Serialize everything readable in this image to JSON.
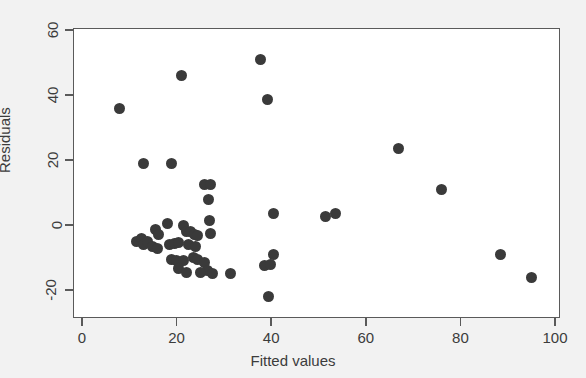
{
  "chart_data": {
    "type": "scatter",
    "title": "",
    "xlabel": "Fitted values",
    "ylabel": "Residuals",
    "xlim": [
      -2,
      102
    ],
    "ylim": [
      -25,
      63
    ],
    "xticks": [
      0,
      20,
      40,
      60,
      80,
      100
    ],
    "xtick_labels": [
      "0",
      "20",
      "40",
      "60",
      "80",
      "100"
    ],
    "yticks": [
      -20,
      0,
      20,
      40,
      60
    ],
    "ytick_labels": [
      "-20",
      "0",
      "20",
      "40",
      "60"
    ],
    "grid": false,
    "legend": null,
    "marker": {
      "shape": "circle",
      "color": "#3a3a3a",
      "size_px": 11
    },
    "background_color": "#f2f2f2",
    "plot_background_color": "#ffffff",
    "axis_color": "#5a5a5a",
    "points": [
      {
        "x": 8.0,
        "y": 36.0
      },
      {
        "x": 13.0,
        "y": 19.0
      },
      {
        "x": 19.0,
        "y": 19.0
      },
      {
        "x": 21.0,
        "y": 46.0
      },
      {
        "x": 37.7,
        "y": 51.0
      },
      {
        "x": 39.3,
        "y": 38.5
      },
      {
        "x": 67.0,
        "y": 23.5
      },
      {
        "x": 76.0,
        "y": 11.0
      },
      {
        "x": 88.5,
        "y": -9.0
      },
      {
        "x": 95.0,
        "y": -16.0
      },
      {
        "x": 26.0,
        "y": 12.5
      },
      {
        "x": 27.2,
        "y": 12.5
      },
      {
        "x": 26.8,
        "y": 8.0
      },
      {
        "x": 27.0,
        "y": 1.5
      },
      {
        "x": 27.2,
        "y": -2.5
      },
      {
        "x": 40.5,
        "y": 3.5
      },
      {
        "x": 51.5,
        "y": 2.5
      },
      {
        "x": 53.5,
        "y": 3.5
      },
      {
        "x": 18.0,
        "y": 0.5
      },
      {
        "x": 21.5,
        "y": 0.0
      },
      {
        "x": 15.5,
        "y": -1.5
      },
      {
        "x": 16.2,
        "y": -3.0
      },
      {
        "x": 22.0,
        "y": -2.0
      },
      {
        "x": 23.0,
        "y": -2.0
      },
      {
        "x": 23.8,
        "y": -2.8
      },
      {
        "x": 24.5,
        "y": -3.2
      },
      {
        "x": 11.5,
        "y": -5.0
      },
      {
        "x": 12.5,
        "y": -4.2
      },
      {
        "x": 13.0,
        "y": -6.0
      },
      {
        "x": 13.8,
        "y": -5.0
      },
      {
        "x": 15.0,
        "y": -6.5
      },
      {
        "x": 16.0,
        "y": -7.2
      },
      {
        "x": 18.5,
        "y": -6.0
      },
      {
        "x": 19.5,
        "y": -5.8
      },
      {
        "x": 20.5,
        "y": -5.5
      },
      {
        "x": 22.5,
        "y": -6.0
      },
      {
        "x": 24.0,
        "y": -6.5
      },
      {
        "x": 19.0,
        "y": -10.5
      },
      {
        "x": 20.0,
        "y": -11.0
      },
      {
        "x": 21.5,
        "y": -11.0
      },
      {
        "x": 23.5,
        "y": -10.0
      },
      {
        "x": 24.5,
        "y": -10.5
      },
      {
        "x": 20.5,
        "y": -13.5
      },
      {
        "x": 22.0,
        "y": -14.5
      },
      {
        "x": 26.0,
        "y": -11.5
      },
      {
        "x": 26.5,
        "y": -14.0
      },
      {
        "x": 27.5,
        "y": -15.0
      },
      {
        "x": 25.0,
        "y": -14.5
      },
      {
        "x": 31.5,
        "y": -15.0
      },
      {
        "x": 38.5,
        "y": -12.5
      },
      {
        "x": 39.8,
        "y": -12.0
      },
      {
        "x": 40.5,
        "y": -9.0
      },
      {
        "x": 39.5,
        "y": -22.0
      }
    ]
  }
}
